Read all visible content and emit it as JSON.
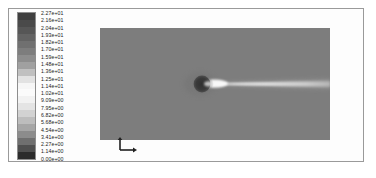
{
  "figure": {
    "kind": "cfd-contour-plot",
    "background_color": "#ffffff",
    "frame_color": "#9a9a9a"
  },
  "legend": {
    "name": "contour-colorbar",
    "orientation": "vertical",
    "level_count": 21,
    "labels": [
      "2.27e+01",
      "2.16e+01",
      "2.04e+01",
      "1.93e+01",
      "1.82e+01",
      "1.70e+01",
      "1.59e+01",
      "1.48e+01",
      "1.36e+01",
      "1.25e+01",
      "1.14e+01",
      "1.02e+01",
      "9.09e+00",
      "7.95e+00",
      "6.82e+00",
      "5.68e+00",
      "4.54e+00",
      "3.41e+00",
      "2.27e+00",
      "1.14e+00",
      "0.00e+00"
    ],
    "values": [
      22.7,
      21.6,
      20.4,
      19.3,
      18.2,
      17.0,
      15.9,
      14.8,
      13.6,
      12.5,
      11.4,
      10.2,
      9.09,
      7.95,
      6.82,
      5.68,
      4.54,
      3.41,
      2.27,
      1.14,
      0.0
    ],
    "swatch_colors": [
      "#3f3f3f",
      "#4a4a4a",
      "#565656",
      "#636363",
      "#707070",
      "#7d7d7d",
      "#8d8d8d",
      "#a0a0a0",
      "#c0c0c0",
      "#e2e2e2",
      "#f6f6f6",
      "#fbfbfb",
      "#f2f2f2",
      "#e4e4e4",
      "#d2d2d2",
      "#bdbdbd",
      "#a6a6a6",
      "#8c8c8c",
      "#6f6f6f",
      "#4f4f4f",
      "#2b2b2b"
    ]
  },
  "plot": {
    "name": "velocity-contour-field",
    "freestream_color": "#7d7d7d",
    "body_color": "#3a3a3a",
    "wake_core_color": "#fbfbfb",
    "wake_mid_color": "#c8c8c8",
    "wake_outer_color": "#9a9a9a",
    "body": {
      "shape": "circle",
      "center_x_frac": 0.455,
      "center_y_frac": 0.5,
      "radius_frac": 0.075
    },
    "wake": {
      "start_x_frac": 0.47,
      "end_x_frac": 1.0,
      "max_half_width_frac": 0.055
    }
  },
  "axis_triad": {
    "name": "coordinate-axis-triad",
    "color": "#202020",
    "x_label": "",
    "y_label": ""
  }
}
